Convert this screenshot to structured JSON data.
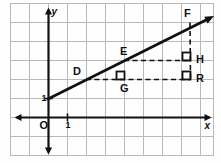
{
  "figure": {
    "kind": "coordinate-grid-geometry-diagram",
    "background": "#fefefe",
    "border_color": "#b9b9b9",
    "grid_color": "#b9b9b9",
    "axis_color": "#111111",
    "line_color": "#111111",
    "dash_color": "#111111"
  },
  "axes": {
    "x_label": "x",
    "y_label": "y",
    "origin_label": "O",
    "x_tick_label": "1",
    "y_tick_label": "1",
    "x_axis_y_px": 117,
    "y_axis_x_px": 48,
    "grid_spacing_px": 19,
    "x_grid_px": [
      10,
      29,
      48,
      67,
      86,
      105,
      124,
      143,
      162,
      181,
      200,
      213
    ],
    "y_grid_px": [
      3,
      22,
      41,
      60,
      79,
      98,
      117,
      136,
      155
    ]
  },
  "points": [
    {
      "name": "D",
      "x_px": 86,
      "y_px": 79,
      "label_dx": -13,
      "label_dy": -13,
      "on_line": true
    },
    {
      "name": "E",
      "x_px": 124,
      "y_px": 60,
      "label_dx": -4,
      "label_dy": -14,
      "on_line": true
    },
    {
      "name": "F",
      "x_px": 190,
      "y_px": 22,
      "label_dx": -6,
      "label_dy": -14,
      "on_line": true
    },
    {
      "name": "G",
      "x_px": 124,
      "y_px": 79,
      "label_dx": -4,
      "label_dy": 4,
      "on_line": false
    },
    {
      "name": "H",
      "x_px": 190,
      "y_px": 60,
      "label_dx": 6,
      "label_dy": -6,
      "on_line": false
    },
    {
      "name": "R",
      "x_px": 190,
      "y_px": 79,
      "label_dx": 6,
      "label_dy": -6,
      "on_line": false
    }
  ],
  "line": {
    "name": "slope-line",
    "x1_px": 48,
    "y1_px": 99,
    "x2_px": 214,
    "y2_px": 16
  },
  "dashed_segments": [
    {
      "name": "D-to-R",
      "x1_px": 86,
      "y1_px": 79,
      "x2_px": 190,
      "y2_px": 79
    },
    {
      "name": "E-to-H",
      "x1_px": 124,
      "y1_px": 60,
      "x2_px": 190,
      "y2_px": 60
    },
    {
      "name": "F-to-R",
      "x1_px": 190,
      "y1_px": 22,
      "x2_px": 190,
      "y2_px": 79
    }
  ],
  "right_angle_marks": [
    {
      "name": "right-angle-at-G",
      "x_px": 124,
      "y_px": 79,
      "dir_x": -1,
      "dir_y": -1
    },
    {
      "name": "right-angle-at-H",
      "x_px": 190,
      "y_px": 60,
      "dir_x": -1,
      "dir_y": -1
    },
    {
      "name": "right-angle-at-R",
      "x_px": 190,
      "y_px": 79,
      "dir_x": -1,
      "dir_y": -1
    }
  ],
  "labels": {
    "D": "D",
    "E": "E",
    "F": "F",
    "G": "G",
    "H": "H",
    "R": "R",
    "x": "x",
    "y": "y",
    "O": "O",
    "one_x": "1",
    "one_y": "1"
  }
}
